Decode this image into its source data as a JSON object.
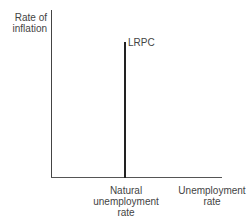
{
  "chart_data": {
    "type": "line",
    "title": "",
    "xlabel": "Unemployment rate",
    "ylabel": "Rate of inflation",
    "grid": false,
    "legend": null,
    "series": [
      {
        "name": "LRPC",
        "description": "Long-run Phillips curve: vertical line at the natural unemployment rate",
        "x": [
          "Natural unemployment rate",
          "Natural unemployment rate"
        ],
        "y": [
          0,
          "high"
        ]
      }
    ],
    "annotations": [
      {
        "text": "LRPC",
        "position": "top of vertical line"
      },
      {
        "text": "Natural unemployment rate",
        "position": "x-axis tick below vertical line"
      }
    ]
  },
  "labels": {
    "y_axis_line1": "Rate of",
    "y_axis_line2": "inflation",
    "curve": "LRPC",
    "natural_line1": "Natural",
    "natural_line2": "unemployment",
    "natural_line3": "rate",
    "x_axis_line1": "Unemployment",
    "x_axis_line2": "rate"
  }
}
